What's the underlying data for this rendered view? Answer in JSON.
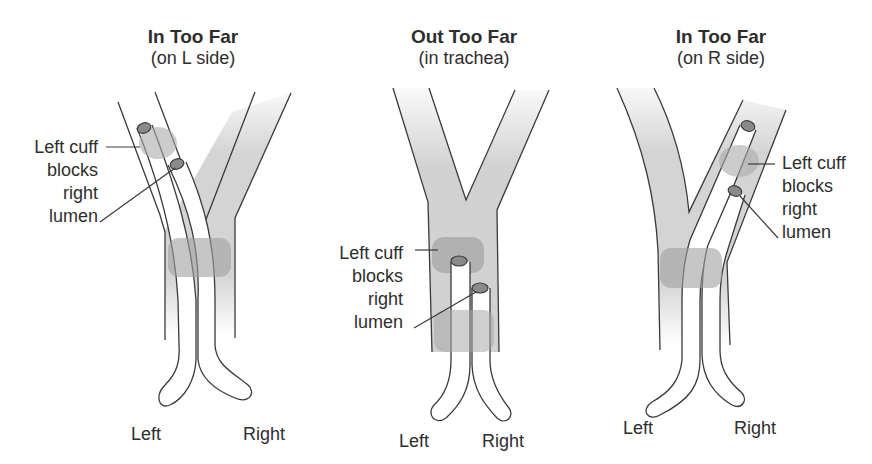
{
  "panels": [
    {
      "title": "In Too Far",
      "subtitle": "(on L side)",
      "annotation": [
        "Left cuff",
        "blocks",
        "right",
        "lumen"
      ],
      "left_label": "Left",
      "right_label": "Right"
    },
    {
      "title": "Out Too Far",
      "subtitle": "(in trachea)",
      "annotation": [
        "Left cuff",
        "blocks",
        "right",
        "lumen"
      ],
      "left_label": "Left",
      "right_label": "Right"
    },
    {
      "title": "In Too Far",
      "subtitle": "(on R side)",
      "annotation": [
        "Left cuff",
        "blocks",
        "right",
        "lumen"
      ],
      "left_label": "Left",
      "right_label": "Right"
    }
  ],
  "colors": {
    "airway_fill": "#d4d4d4",
    "cuff_fill": "#a8a8a8",
    "lumen_cap": "#8a8a8a",
    "line": "#3a3a3a",
    "text": "#2e2e2e"
  }
}
